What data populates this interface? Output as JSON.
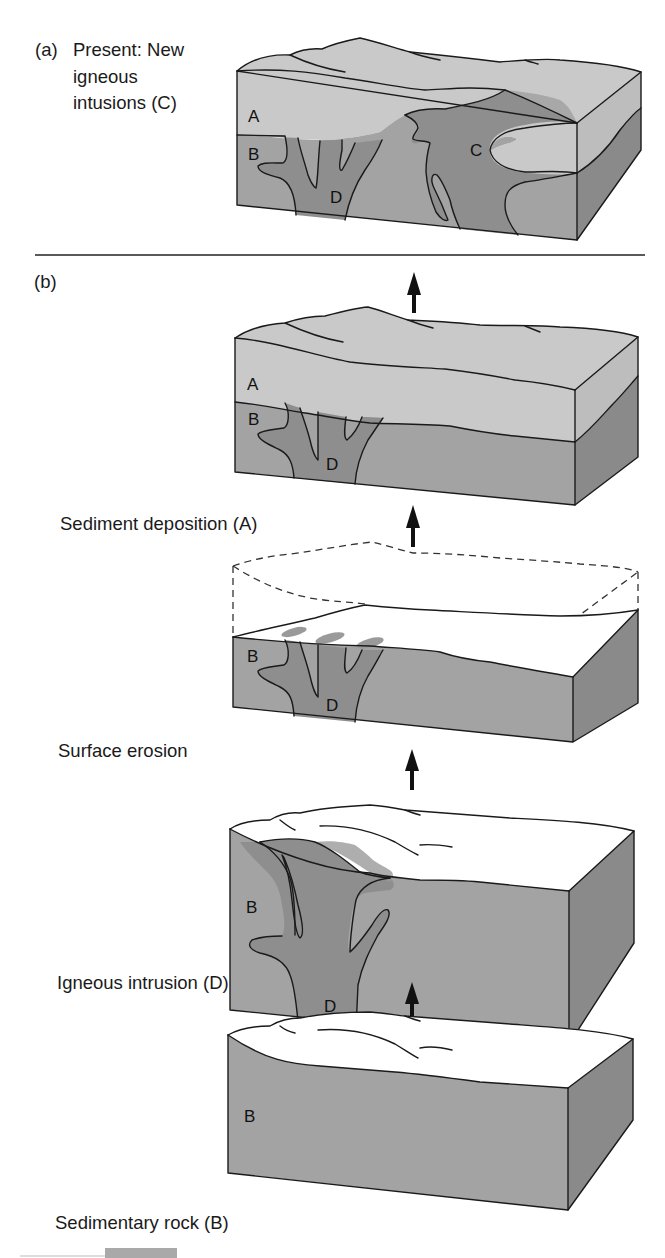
{
  "figure": {
    "panel_a": {
      "marker": "(a)",
      "caption_lines": [
        "Present:  New",
        "igneous",
        "intusions (C)"
      ],
      "block_labels": {
        "A": "A",
        "B": "B",
        "C": "C",
        "D": "D"
      }
    },
    "panel_b": {
      "marker": "(b)",
      "stages": [
        {
          "id": "stage-sediment-deposition",
          "caption": "Sediment deposition (A)",
          "block_labels": {
            "A": "A",
            "B": "B",
            "D": "D"
          }
        },
        {
          "id": "stage-surface-erosion",
          "caption": "Surface erosion",
          "block_labels": {
            "B": "B",
            "D": "D"
          }
        },
        {
          "id": "stage-igneous-intrusion",
          "caption": "Igneous intrusion (D)",
          "block_labels": {
            "B": "B",
            "D": "D"
          }
        },
        {
          "id": "stage-sedimentary-rock",
          "caption": "Sedimentary rock (B)",
          "block_labels": {
            "B": "B"
          }
        }
      ]
    },
    "legend": {
      "units": [
        {
          "key": "A",
          "meaning": "Sediment deposition"
        },
        {
          "key": "B",
          "meaning": "Sedimentary rock"
        },
        {
          "key": "C",
          "meaning": "New igneous intrusions"
        },
        {
          "key": "D",
          "meaning": "Igneous intrusion"
        }
      ]
    },
    "colors": {
      "layer_A": "#c9c9c9",
      "layer_B": "#a3a3a3",
      "igneous": "#8e8e8e",
      "side_face": "#8a8a8a",
      "eroded_surface": "#ffffff",
      "outline": "#1a1a1a"
    },
    "time_direction": "arrows point upward from oldest (bottom) to present (top)"
  }
}
